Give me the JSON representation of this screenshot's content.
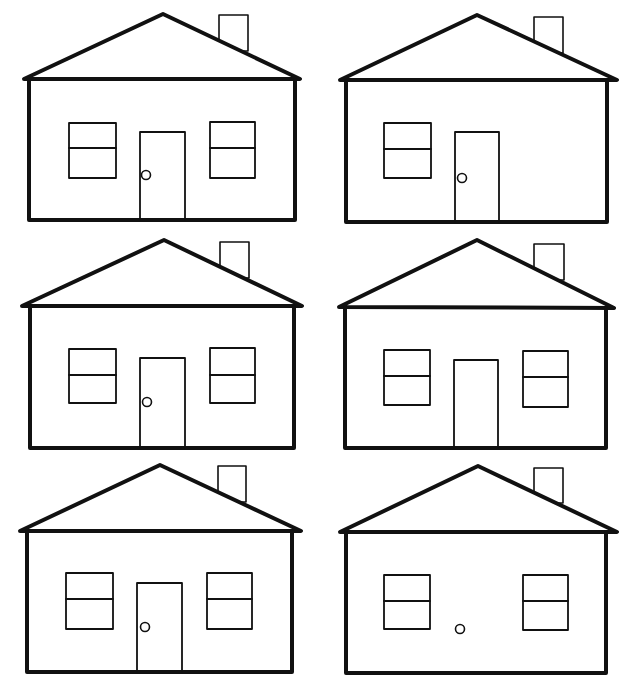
{
  "colors": {
    "ink": "#111111",
    "paper": "#ffffff"
  },
  "houses": [
    {
      "label": "House 1",
      "parts": [
        "roof",
        "chimney",
        "walls",
        "left-window",
        "door",
        "doorknob",
        "right-window"
      ],
      "missing": []
    },
    {
      "label": "House 2",
      "parts": [
        "roof",
        "chimney",
        "walls",
        "left-window",
        "door",
        "doorknob"
      ],
      "missing": [
        "right-window"
      ]
    },
    {
      "label": "House 3",
      "parts": [
        "roof",
        "chimney",
        "walls",
        "left-window",
        "door",
        "doorknob",
        "right-window"
      ],
      "missing": []
    },
    {
      "label": "House 4",
      "parts": [
        "roof",
        "chimney",
        "walls",
        "left-window",
        "door",
        "right-window"
      ],
      "missing": [
        "doorknob"
      ]
    },
    {
      "label": "House 5",
      "parts": [
        "roof",
        "chimney",
        "walls",
        "left-window",
        "door",
        "doorknob",
        "right-window"
      ],
      "missing": []
    },
    {
      "label": "House 6",
      "parts": [
        "roof",
        "chimney",
        "walls",
        "left-window",
        "doorknob",
        "right-window"
      ],
      "missing": [
        "door"
      ]
    }
  ]
}
